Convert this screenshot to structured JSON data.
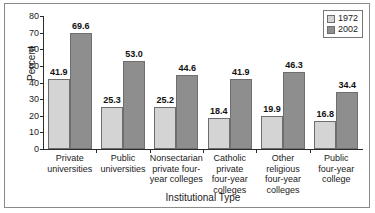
{
  "chart_data": {
    "type": "bar",
    "title": "",
    "xlabel": "Institutional Type",
    "ylabel": "Percent",
    "ylim": [
      0,
      80
    ],
    "yticks": [
      0,
      10,
      20,
      30,
      40,
      50,
      60,
      70,
      80
    ],
    "grid": false,
    "legend_position": "top-right",
    "categories": [
      "Private universities",
      "Public universities",
      "Nonsectarian private four-year colleges",
      "Catholic private four-year colleges",
      "Other religious four-year colleges",
      "Public four-year college"
    ],
    "category_lines": [
      [
        "Private",
        "universities"
      ],
      [
        "Public",
        "universities"
      ],
      [
        "Nonsectarian",
        "private four-",
        "year colleges"
      ],
      [
        "Catholic",
        "private",
        "four-year",
        "colleges"
      ],
      [
        "Other",
        "religious",
        "four-year",
        "colleges"
      ],
      [
        "Public",
        "four-year",
        "college"
      ]
    ],
    "series": [
      {
        "name": "1972",
        "color": "#d4d4d4",
        "values": [
          41.9,
          25.3,
          25.2,
          18.4,
          19.9,
          16.8
        ],
        "labels": [
          "41.9",
          "25.3",
          "25.2",
          "18.4",
          "19.9",
          "16.8"
        ]
      },
      {
        "name": "2002",
        "color": "#8e8e8e",
        "values": [
          69.6,
          53.0,
          44.6,
          41.9,
          46.3,
          34.4
        ],
        "labels": [
          "69.6",
          "53.0",
          "44.6",
          "41.9",
          "46.3",
          "34.4"
        ]
      }
    ]
  },
  "legend": {
    "items": [
      {
        "label": "1972",
        "color": "#d4d4d4"
      },
      {
        "label": "2002",
        "color": "#8e8e8e"
      }
    ]
  },
  "axis": {
    "y_tick_labels": [
      "80",
      "70",
      "60",
      "50",
      "40",
      "30",
      "20",
      "10",
      "0"
    ],
    "y_title": "Percent",
    "x_title": "Institutional Type"
  }
}
